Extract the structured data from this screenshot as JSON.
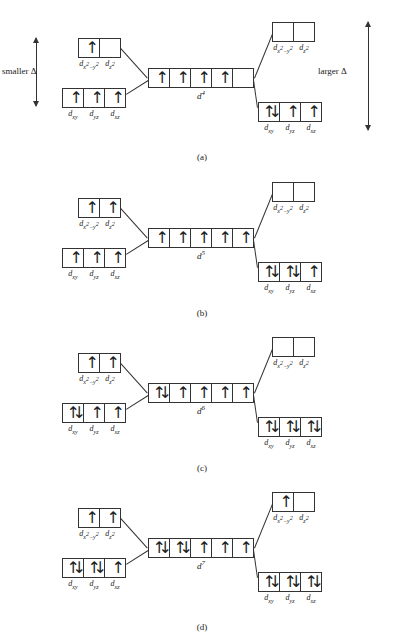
{
  "figure": {
    "annotations": {
      "smaller_delta": "smaller Δ",
      "larger_delta": "larger Δ"
    },
    "orbital_labels": {
      "eg": [
        "d",
        "x",
        "2",
        "−",
        "y",
        "2",
        "z",
        "2"
      ],
      "eg_first_html": "d<sub>x<sup>2</sup>−y<sup>2</sup></sub>",
      "eg_second_html": "d<sub>z<sup>2</sup></sub>",
      "t2g": [
        "d_xy",
        "d_yz",
        "d_xz"
      ]
    },
    "glyphs": {
      "up_arrow": "↑",
      "down_arrow": "↓"
    }
  },
  "panels": [
    {
      "id": "a",
      "caption": "(a)",
      "center": {
        "config_label": "d",
        "config_superscript": "4",
        "cells": [
          "up",
          "up",
          "up",
          "up",
          "empty"
        ]
      },
      "weak_field": {
        "delta_text": "smaller Δ",
        "eg": {
          "cells": [
            "up",
            "empty"
          ],
          "labels": [
            "d_x2-y2",
            "d_z2"
          ]
        },
        "t2g": {
          "cells": [
            "up",
            "up",
            "up"
          ],
          "labels": [
            "d_xy",
            "d_yz",
            "d_xz"
          ]
        }
      },
      "strong_field": {
        "delta_text": "larger Δ",
        "eg": {
          "cells": [
            "empty",
            "empty"
          ],
          "labels": [
            "d_x2-y2",
            "d_z2"
          ]
        },
        "t2g": {
          "cells": [
            "pair",
            "up",
            "up"
          ],
          "labels": [
            "d_xy",
            "d_yz",
            "d_xz"
          ]
        }
      }
    },
    {
      "id": "b",
      "caption": "(b)",
      "center": {
        "config_label": "d",
        "config_superscript": "5",
        "cells": [
          "up",
          "up",
          "up",
          "up",
          "up"
        ]
      },
      "weak_field": {
        "eg": {
          "cells": [
            "up",
            "up"
          ],
          "labels": [
            "d_x2-y2",
            "d_z2"
          ]
        },
        "t2g": {
          "cells": [
            "up",
            "up",
            "up"
          ],
          "labels": [
            "d_xy",
            "d_yz",
            "d_xz"
          ]
        }
      },
      "strong_field": {
        "eg": {
          "cells": [
            "empty",
            "empty"
          ],
          "labels": [
            "d_x2-y2",
            "d_z2"
          ]
        },
        "t2g": {
          "cells": [
            "pair",
            "pair",
            "up"
          ],
          "labels": [
            "d_xy",
            "d_yz",
            "d_xz"
          ]
        }
      }
    },
    {
      "id": "c",
      "caption": "(c)",
      "center": {
        "config_label": "d",
        "config_superscript": "6",
        "cells": [
          "pair",
          "up",
          "up",
          "up",
          "up"
        ]
      },
      "weak_field": {
        "eg": {
          "cells": [
            "up",
            "up"
          ],
          "labels": [
            "d_x2-y2",
            "d_z2"
          ]
        },
        "t2g": {
          "cells": [
            "pair",
            "up",
            "up"
          ],
          "labels": [
            "d_xy",
            "d_yz",
            "d_xz"
          ]
        }
      },
      "strong_field": {
        "eg": {
          "cells": [
            "empty",
            "empty"
          ],
          "labels": [
            "d_x2-y2",
            "d_z2"
          ]
        },
        "t2g": {
          "cells": [
            "pair",
            "pair",
            "pair"
          ],
          "labels": [
            "d_xy",
            "d_yz",
            "d_xz"
          ]
        }
      }
    },
    {
      "id": "d",
      "caption": "(d)",
      "center": {
        "config_label": "d",
        "config_superscript": "7",
        "cells": [
          "pair",
          "pair",
          "up",
          "up",
          "up"
        ]
      },
      "weak_field": {
        "eg": {
          "cells": [
            "up",
            "up"
          ],
          "labels": [
            "d_x2-y2",
            "d_z2"
          ]
        },
        "t2g": {
          "cells": [
            "pair",
            "pair",
            "up"
          ],
          "labels": [
            "d_xy",
            "d_yz",
            "d_xz"
          ]
        }
      },
      "strong_field": {
        "eg": {
          "cells": [
            "up",
            "empty"
          ],
          "labels": [
            "d_x2-y2",
            "d_z2"
          ]
        },
        "t2g": {
          "cells": [
            "pair",
            "pair",
            "pair"
          ],
          "labels": [
            "d_xy",
            "d_yz",
            "d_xz"
          ]
        }
      }
    }
  ]
}
